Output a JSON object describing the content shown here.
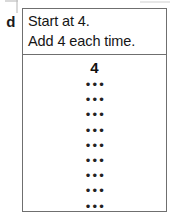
{
  "item": {
    "label": "d"
  },
  "instructions": {
    "line1": "Start at 4.",
    "line2": "Add 4 each time."
  },
  "sequence": {
    "start_value": "4",
    "blank_rows": [
      {
        "marks": "•••"
      },
      {
        "marks": "•••"
      },
      {
        "marks": "•••"
      },
      {
        "marks": "•••"
      },
      {
        "marks": "•••"
      },
      {
        "marks": "•••"
      },
      {
        "marks": "•••"
      },
      {
        "marks": "•••"
      },
      {
        "marks": "•••"
      }
    ]
  },
  "colors": {
    "border": "#6f6f6f",
    "text": "#161616",
    "background": "#ffffff"
  }
}
